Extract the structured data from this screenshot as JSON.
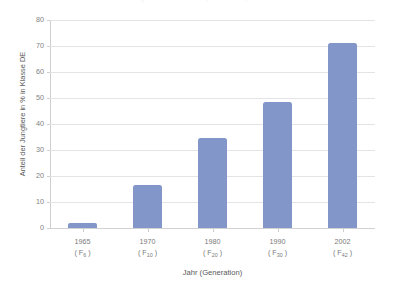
{
  "chart_data": {
    "type": "bar",
    "title": "",
    "title_remnant": "Anteil der Jungtiere in Klasse DE (Generation)",
    "xlabel": "Jahr (Generation)",
    "ylabel": "Anteil der Jungtiere in % in Klasse DE",
    "categories": [
      "1965",
      "1970",
      "1980",
      "1990",
      "2002"
    ],
    "generations": [
      "F6",
      "F10",
      "F20",
      "F30",
      "F42"
    ],
    "generation_labels": [
      {
        "base": "( F",
        "sub": "6",
        "close": " )"
      },
      {
        "base": "( F",
        "sub": "10",
        "close": " )"
      },
      {
        "base": "( F",
        "sub": "20",
        "close": " )"
      },
      {
        "base": "( F",
        "sub": "30",
        "close": " )"
      },
      {
        "base": "( F",
        "sub": "42",
        "close": " )"
      }
    ],
    "values": [
      2,
      16.7,
      34.5,
      48.5,
      71
    ],
    "ylim": [
      0,
      80
    ],
    "ytick_step": 10,
    "yticks": [
      "80",
      "70",
      "60",
      "50",
      "40",
      "30",
      "20",
      "10",
      "0"
    ],
    "grid": true,
    "legend": false,
    "bar_color": "#8296c9",
    "gridline_color": "#e4e4e6",
    "axis_color": "#cfcfd1",
    "text_color": "#7a7a7a",
    "background": "#ffffff"
  }
}
